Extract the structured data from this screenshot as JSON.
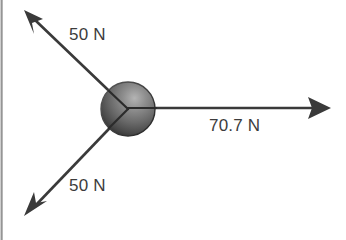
{
  "figure": {
    "name": "force-vector-diagram",
    "background_color": "#ffffff",
    "edge_strip_color": "#8e8e8e"
  },
  "body_object": {
    "name": "sphere",
    "shape": "sphere",
    "center_x": 128,
    "center_y": 109,
    "radius": 27,
    "fill_dark": "#2f2f2f",
    "fill_mid": "#6e6e6e",
    "fill_light": "#a8a8a8"
  },
  "vectors": [
    {
      "id": "force-upper-left",
      "label": "50 N",
      "magnitude": 50,
      "unit": "N",
      "direction": "up-left",
      "angle_deg": 139,
      "color": "#3a3a3a",
      "tail_x": 128,
      "tail_y": 109,
      "tip_x": 26,
      "tip_y": 12
    },
    {
      "id": "force-lower-left",
      "label": "50 N",
      "magnitude": 50,
      "unit": "N",
      "direction": "down-left",
      "angle_deg": 221,
      "color": "#3a3a3a",
      "tail_x": 128,
      "tail_y": 109,
      "tip_x": 26,
      "tip_y": 214
    },
    {
      "id": "force-resultant-right",
      "label": "70.7 N",
      "magnitude": 70.7,
      "unit": "N",
      "direction": "right",
      "angle_deg": 0,
      "color": "#3a3a3a",
      "tail_x": 128,
      "tail_y": 108,
      "tip_x": 330,
      "tip_y": 108
    }
  ],
  "labels": {
    "upper": "50 N",
    "lower": "50 N",
    "resultant": "70.7 N"
  }
}
